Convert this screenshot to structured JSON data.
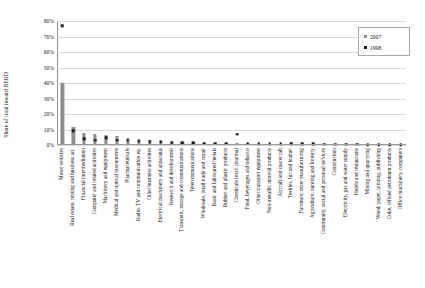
{
  "chart_data": {
    "type": "bar",
    "title": "",
    "xlabel": "",
    "ylabel": "Share of total inward BERD",
    "ylim": [
      0,
      80
    ],
    "ytick_labels": [
      "80%",
      "70%",
      "60%",
      "50%",
      "40%",
      "30%",
      "20%",
      "10%",
      "0%"
    ],
    "ytick_values": [
      80,
      70,
      60,
      50,
      40,
      30,
      20,
      10,
      0
    ],
    "grid": true,
    "legend_position": "top-right",
    "categories": [
      "Motor vehicles",
      "Real estate, renting and business act.",
      "Financial intermediation",
      "Computer and related activities",
      "Machinery and equipment",
      "Medical and optical instruments",
      "Pharmaceuticals",
      "Radio, TV and communication eq.",
      "Other business activities",
      "Electrical machinery and apparatus",
      "Research and development",
      "Transport, storage and communications",
      "Telecommunications",
      "Wholesale, retail trade and repair",
      "Basic and fabricated metals",
      "Rubber and plastic products",
      "Chemicals (excl. pharma)",
      "Food, beverages and tobacco",
      "Other transport equipment",
      "Non-metallic mineral products",
      "Aircraft and spacecraft",
      "Textiles, fur and leather",
      "Furniture, other manufacturing",
      "Agriculture, hunting and forestry",
      "Community, social and personal services",
      "Construction",
      "Electricity, gas and water supply",
      "Hotels and restaurants",
      "Mining and quarrying",
      "Wood, paper, printing, publishing",
      "Coke, refined petroleum products",
      "Office machinery, computers"
    ],
    "series": [
      {
        "name": "2007",
        "color": "#8e8e8e",
        "marker": "bar",
        "values": [
          40.0,
          11.5,
          8.0,
          7.2,
          6.6,
          6.0,
          4.6,
          3.6,
          3.0,
          2.8,
          2.4,
          2.0,
          1.8,
          1.6,
          1.4,
          1.2,
          1.1,
          1.0,
          0.9,
          0.8,
          0.7,
          0.6,
          0.5,
          0.5,
          0.4,
          0.4,
          0.3,
          0.3,
          0.2,
          0.2,
          0.2,
          0.1
        ]
      },
      {
        "name": "1998",
        "color": "#1b1b1b",
        "marker": "square",
        "values": [
          77.0,
          9.0,
          4.0,
          3.0,
          4.5,
          3.0,
          3.0,
          2.5,
          2.0,
          2.0,
          1.5,
          1.4,
          1.3,
          1.2,
          1.2,
          1.0,
          7.0,
          1.0,
          0.9,
          0.8,
          0.8,
          0.7,
          0.6,
          0.6,
          0.5,
          0.5,
          0.4,
          0.4,
          0.3,
          0.3,
          0.3,
          0.2
        ]
      }
    ]
  },
  "legend": {
    "items": [
      {
        "label": "2007"
      },
      {
        "label": "1998"
      }
    ]
  }
}
